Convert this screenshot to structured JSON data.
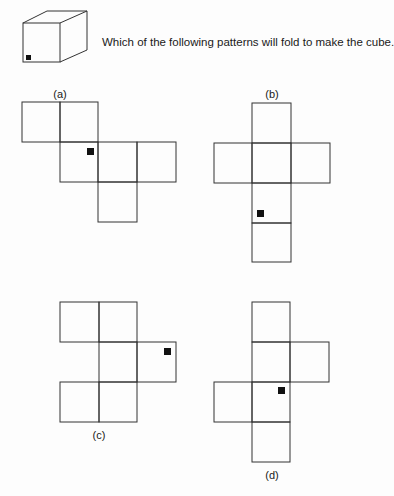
{
  "question": "Which of the following patterns will fold to make the cube.",
  "cube": {
    "description": "isometric cube with a small black square in the bottom-left corner of the front face"
  },
  "options": [
    {
      "id": "a",
      "label": "(a)"
    },
    {
      "id": "b",
      "label": "(b)"
    },
    {
      "id": "c",
      "label": "(c)"
    },
    {
      "id": "d",
      "label": "(d)"
    }
  ],
  "colors": {
    "line": "#333333",
    "marker": "#111111",
    "background": "#fdfdfd"
  }
}
